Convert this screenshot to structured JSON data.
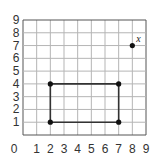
{
  "chart_data": {
    "type": "scatter",
    "title": "",
    "xlabel": "",
    "ylabel": "",
    "xlim": [
      0,
      9
    ],
    "ylim": [
      0,
      9
    ],
    "grid": true,
    "x_ticks": [
      "0",
      "1",
      "2",
      "3",
      "4",
      "5",
      "6",
      "7",
      "8",
      "9"
    ],
    "y_ticks": [
      "1",
      "2",
      "3",
      "4",
      "5",
      "6",
      "7",
      "8",
      "9"
    ],
    "polygon": {
      "name": "rectangle",
      "vertices": [
        [
          2,
          1
        ],
        [
          2,
          4
        ],
        [
          7,
          4
        ],
        [
          7,
          1
        ]
      ]
    },
    "points": [
      {
        "x": 2,
        "y": 1,
        "label": ""
      },
      {
        "x": 2,
        "y": 4,
        "label": ""
      },
      {
        "x": 7,
        "y": 4,
        "label": ""
      },
      {
        "x": 7,
        "y": 1,
        "label": ""
      },
      {
        "x": 8,
        "y": 7,
        "label": "x"
      }
    ],
    "colors": {
      "grid": "#b5b5b5",
      "axis": "#555555",
      "shape": "#333333",
      "point": "#111111"
    }
  }
}
